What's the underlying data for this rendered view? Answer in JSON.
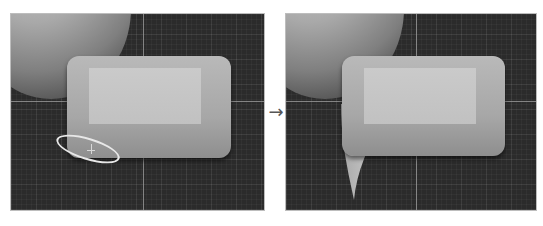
{
  "figure": {
    "panels": [
      {
        "id": "before",
        "label": "before",
        "features": [
          "sphere",
          "rounded-slab",
          "selection-ellipse",
          "grid-floor"
        ]
      },
      {
        "id": "after",
        "label": "after",
        "features": [
          "sphere",
          "rounded-slab-with-spike",
          "grid-floor"
        ]
      }
    ],
    "transition_arrow": "→"
  },
  "colors": {
    "viewport_bg": "#2b2b2b",
    "mesh_light": "#c4c4c4",
    "mesh_mid": "#a7a7a7",
    "selection_ring": "#e8e8e8",
    "arrow": "#555555"
  }
}
